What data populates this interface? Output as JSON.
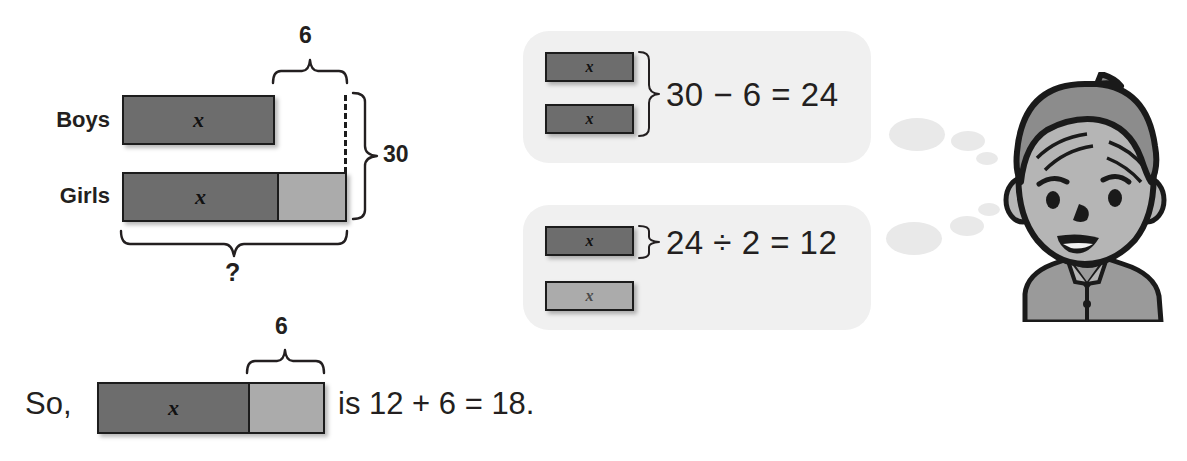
{
  "model_diagram": {
    "rows": [
      {
        "label": "Boys",
        "variable": "x"
      },
      {
        "label": "Girls",
        "variable": "x"
      }
    ],
    "brace_top_label": "6",
    "brace_right_label": "30",
    "brace_bottom_label": "?"
  },
  "thought_panels": [
    {
      "bars": [
        {
          "variable": "x",
          "shade": "dark"
        },
        {
          "variable": "x",
          "shade": "dark"
        }
      ],
      "equation": "30 − 6 = 24"
    },
    {
      "bars": [
        {
          "variable": "x",
          "shade": "dark"
        },
        {
          "variable": "x",
          "shade": "light"
        }
      ],
      "equation": "24 ÷ 2 = 12"
    }
  ],
  "conclusion": {
    "lead_text": "So,",
    "bar_variable": "x",
    "brace_label": "6",
    "trailing_text": "is 12 + 6 = 18."
  },
  "character": {
    "name": "boy-thinking",
    "hair_color": "#8c8c8c",
    "skin_color": "#b5b5b5",
    "shirt_color": "#9a9a9a",
    "outline_color": "#1a1a1a"
  },
  "colors": {
    "bar_dark": "#6d6d6d",
    "bar_light": "#ababab",
    "panel_background": "#f0f0f0",
    "thought_dot": "#e9e9e9",
    "ink": "#231f20"
  }
}
